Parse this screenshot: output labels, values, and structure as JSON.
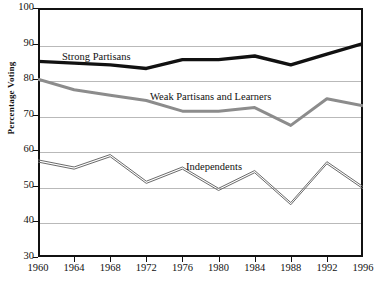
{
  "chart_data": {
    "type": "line",
    "title": "",
    "xlabel": "",
    "ylabel": "Percentage Voting",
    "x": [
      1960,
      1964,
      1968,
      1972,
      1976,
      1980,
      1984,
      1988,
      1992,
      1996
    ],
    "xtick_labels": [
      "1960",
      "1964",
      "1968",
      "1972",
      "1976",
      "1980",
      "1984",
      "1988",
      "1992",
      "1996"
    ],
    "ytick_labels": [
      "100",
      "90",
      "80",
      "70",
      "60",
      "50",
      "40",
      "30"
    ],
    "ytick_values": [
      100,
      90,
      80,
      70,
      60,
      50,
      40,
      30
    ],
    "ylim": [
      30,
      100
    ],
    "xlim": [
      1960,
      1996
    ],
    "grid": "horizontal",
    "legend": "inline-annotations",
    "series": [
      {
        "name": "Strong Partisans",
        "color": "#111111",
        "width": 3.4,
        "style": "solid-thick",
        "values": [
          85,
          84.5,
          84,
          83,
          85.5,
          85.5,
          86.5,
          84,
          87,
          90
        ]
      },
      {
        "name": "Weak Partisans and Learners",
        "color": "#8c8c8c",
        "width": 3.0,
        "style": "solid-thick-gray",
        "values": [
          80,
          77,
          75.5,
          74,
          71,
          71,
          72,
          67,
          74.5,
          72.5
        ]
      },
      {
        "name": "Independents",
        "color": "#6b6b6b",
        "width": 1.0,
        "style": "double-thin",
        "values": [
          57,
          55,
          58.5,
          51,
          55,
          49,
          54,
          45,
          56.5,
          49.5
        ]
      }
    ],
    "annotations": [
      {
        "text": "Strong Partisans",
        "series": "Strong Partisans"
      },
      {
        "text": "Weak Partisans and Learners",
        "series": "Weak Partisans and Learners"
      },
      {
        "text": "Independents",
        "series": "Independents"
      }
    ]
  }
}
